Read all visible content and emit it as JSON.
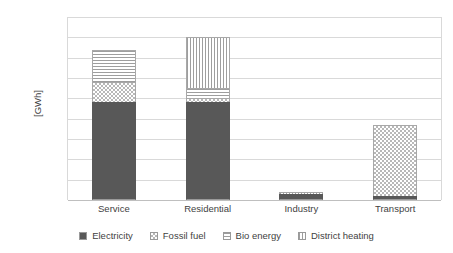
{
  "chart_data": {
    "type": "bar",
    "stacked": true,
    "title": "",
    "xlabel": "",
    "ylabel": "[GWh]",
    "ylim": [
      0,
      9000
    ],
    "ytick_labels": [
      "9000",
      "8000",
      "7000",
      "6000",
      "5000",
      "4000",
      "3000",
      "2000",
      "1000",
      "0"
    ],
    "ytick_values": [
      9000,
      8000,
      7000,
      6000,
      5000,
      4000,
      3000,
      2000,
      1000,
      0
    ],
    "grid": true,
    "legend_position": "bottom",
    "categories": [
      "Service",
      "Residential",
      "Industry",
      "Transport"
    ],
    "series": [
      {
        "name": "Electricity",
        "pattern": "solid-dark",
        "values": [
          4800,
          4800,
          300,
          200
        ]
      },
      {
        "name": "Fossil fuel",
        "pattern": "checker",
        "values": [
          1000,
          200,
          0,
          3500
        ]
      },
      {
        "name": "Bio energy",
        "pattern": "horizontal-lines",
        "values": [
          1600,
          500,
          0,
          0
        ]
      },
      {
        "name": "District heating",
        "pattern": "vertical-lines",
        "values": [
          0,
          2500,
          100,
          0
        ]
      }
    ],
    "totals": [
      7400,
      8000,
      400,
      3700
    ]
  },
  "colors": {
    "electricity": "#585858",
    "pattern_line": "#9e9e9e",
    "gridline": "#d9d9d9",
    "text": "#3f3f3f",
    "background": "#ffffff"
  }
}
